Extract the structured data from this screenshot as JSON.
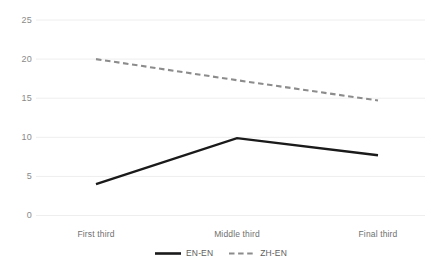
{
  "chart_data": {
    "type": "line",
    "title": "",
    "xlabel": "",
    "ylabel": "",
    "categories": [
      "First third",
      "Middle third",
      "Final third"
    ],
    "series": [
      {
        "name": "EN-EN",
        "values": [
          4.0,
          9.9,
          7.7
        ],
        "style": "solid",
        "color": "#1a1a1a"
      },
      {
        "name": "ZH-EN",
        "values": [
          20.0,
          17.3,
          14.7
        ],
        "style": "dashed",
        "color": "#8c8c8c"
      }
    ],
    "ylim": [
      0,
      25
    ],
    "yticks": [
      0,
      5,
      10,
      15,
      20,
      25
    ],
    "ytick_labels": [
      "0",
      "5",
      "10",
      "15",
      "20",
      "25"
    ],
    "grid": true,
    "grid_color": "#eeeeee",
    "legend_position": "bottom",
    "background": "#ffffff"
  },
  "axes": {
    "y_labels": [
      "25",
      "20",
      "15",
      "10",
      "5",
      "0"
    ],
    "x_labels": [
      "First third",
      "Middle third",
      "Final third"
    ]
  },
  "legend": {
    "items": [
      {
        "label": "EN-EN"
      },
      {
        "label": "ZH-EN"
      }
    ]
  }
}
